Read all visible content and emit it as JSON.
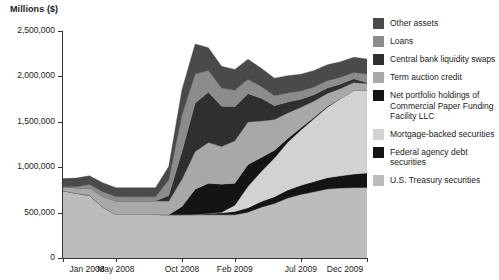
{
  "chart_data": {
    "type": "area",
    "stacked": true,
    "title": "Millions ($)",
    "xlabel": "",
    "ylabel": "Millions ($)",
    "ylim": [
      0,
      2500000
    ],
    "ytick_labels": [
      "0",
      "500,000",
      "1,000,000",
      "1,500,000",
      "2,000,000",
      "2,500,000"
    ],
    "ytick_values": [
      0,
      500000,
      1000000,
      1500000,
      2000000,
      2500000
    ],
    "grid": false,
    "legend_position": "right",
    "xtick_labels": [
      "Jan 2008",
      "May 2008",
      "Oct 2008",
      "Feb 2009",
      "Jul 2009",
      "Dec 2009"
    ],
    "xtick_positions": [
      0,
      4,
      9,
      13,
      18,
      23
    ],
    "x": [
      "Jan 2008",
      "Feb 2008",
      "Mar 2008",
      "Apr 2008",
      "May 2008",
      "Jun 2008",
      "Jul 2008",
      "Aug 2008",
      "Sep 2008",
      "Oct 2008",
      "Nov 2008",
      "Dec 2008",
      "Jan 2009",
      "Feb 2009",
      "Mar 2009",
      "Apr 2009",
      "May 2009",
      "Jun 2009",
      "Jul 2009",
      "Aug 2009",
      "Sep 2009",
      "Oct 2009",
      "Nov 2009",
      "Dec 2009"
    ],
    "series": [
      {
        "name": "U.S. Treasury securities",
        "color": "#bcbcbc",
        "values": [
          740000,
          713000,
          690000,
          560000,
          479000,
          479000,
          479000,
          479000,
          476000,
          476000,
          476000,
          476000,
          475000,
          475000,
          505000,
          560000,
          600000,
          660000,
          700000,
          730000,
          760000,
          770000,
          775000,
          777000
        ]
      },
      {
        "name": "Federal agency debt securities",
        "color": "#141414",
        "values": [
          0,
          0,
          0,
          0,
          0,
          0,
          0,
          0,
          0,
          0,
          2000,
          14000,
          22000,
          38000,
          48000,
          62000,
          75000,
          88000,
          100000,
          112000,
          125000,
          135000,
          150000,
          160000
        ]
      },
      {
        "name": "Mortgage-backed securities",
        "color": "#d2d2d2",
        "values": [
          0,
          0,
          0,
          0,
          0,
          0,
          0,
          0,
          0,
          0,
          0,
          0,
          7000,
          68000,
          236000,
          330000,
          427000,
          526000,
          610000,
          693000,
          775000,
          852000,
          920000,
          909000
        ]
      },
      {
        "name": "Net portfolio holdings of Commercial Paper Funding Facility LLC",
        "color": "#141414",
        "values": [
          0,
          0,
          0,
          0,
          0,
          0,
          0,
          0,
          0,
          90000,
          280000,
          332000,
          309000,
          242000,
          242000,
          154000,
          84000,
          41000,
          25000,
          16000,
          10000,
          0,
          0,
          0
        ]
      },
      {
        "name": "Term auction credit",
        "color": "#a8a8a8",
        "values": [
          40000,
          60000,
          80000,
          120000,
          150000,
          150000,
          150000,
          150000,
          150000,
          300000,
          415000,
          450000,
          416000,
          468000,
          468000,
          403000,
          340000,
          283000,
          224000,
          178000,
          143000,
          109000,
          88000,
          75000
        ]
      },
      {
        "name": "Central bank liquidity swaps",
        "color": "#2f2f2f",
        "values": [
          0,
          0,
          0,
          0,
          0,
          0,
          0,
          0,
          62000,
          308000,
          533000,
          554000,
          442000,
          376000,
          310000,
          250000,
          150000,
          120000,
          90000,
          70000,
          60000,
          50000,
          40000,
          10000
        ]
      },
      {
        "name": "Loans",
        "color": "#8c8c8c",
        "values": [
          5000,
          12000,
          40000,
          50000,
          45000,
          45000,
          45000,
          45000,
          170000,
          400000,
          320000,
          240000,
          200000,
          180000,
          160000,
          130000,
          110000,
          100000,
          90000,
          85000,
          80000,
          75000,
          70000,
          95000
        ]
      },
      {
        "name": "Other assets",
        "color": "#4a4a4a",
        "values": [
          90000,
          95000,
          95000,
          100000,
          100000,
          100000,
          100000,
          100000,
          150000,
          280000,
          330000,
          250000,
          240000,
          230000,
          220000,
          200000,
          195000,
          190000,
          185000,
          180000,
          175000,
          170000,
          168000,
          165000
        ]
      }
    ]
  },
  "legend": {
    "items": [
      {
        "label": "Other assets",
        "color": "#4a4a4a"
      },
      {
        "label": "Loans",
        "color": "#8c8c8c"
      },
      {
        "label": "Central bank liquidity swaps",
        "color": "#2f2f2f"
      },
      {
        "label": "Term auction credit",
        "color": "#a8a8a8"
      },
      {
        "label": "Net portfolio holdings of Commercial Paper Funding Facility LLC",
        "color": "#141414"
      },
      {
        "label": "Mortgage-backed securities",
        "color": "#d2d2d2"
      },
      {
        "label": "Federal agency debt securities",
        "color": "#141414"
      },
      {
        "label": "U.S. Treasury securities",
        "color": "#bcbcbc"
      }
    ]
  }
}
